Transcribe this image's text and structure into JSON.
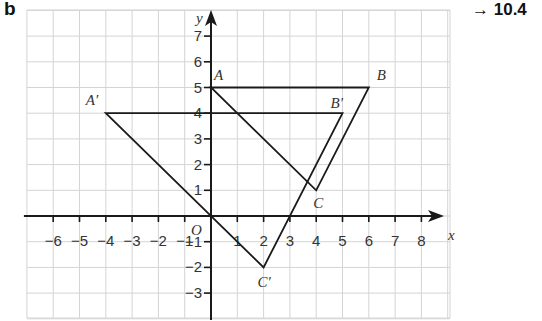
{
  "part_label": "b",
  "reference": {
    "arrow": "→",
    "number": "10.4"
  },
  "axes": {
    "x_label": "x",
    "y_label": "y",
    "origin_label": "O",
    "x_ticks": [
      -6,
      -5,
      -4,
      -3,
      -2,
      -1,
      1,
      2,
      3,
      4,
      5,
      6,
      7,
      8
    ],
    "y_ticks": [
      -3,
      -2,
      -1,
      1,
      2,
      3,
      4,
      5,
      6,
      7
    ],
    "x_range": [
      -7,
      9
    ],
    "y_range": [
      -4,
      8
    ]
  },
  "shapes": [
    {
      "name": "ABC",
      "vertices": [
        {
          "label": "A",
          "x": 0,
          "y": 5
        },
        {
          "label": "B",
          "x": 6,
          "y": 5
        },
        {
          "label": "C",
          "x": 4,
          "y": 1
        }
      ]
    },
    {
      "name": "A'B'C'",
      "vertices": [
        {
          "label": "A′",
          "x": -4,
          "y": 4
        },
        {
          "label": "B′",
          "x": 5,
          "y": 4
        },
        {
          "label": "C′",
          "x": 2,
          "y": -2
        }
      ]
    }
  ],
  "colors": {
    "grid": "#d4d4d4",
    "axis": "#1a1a1a",
    "shape": "#1a1a1a"
  }
}
